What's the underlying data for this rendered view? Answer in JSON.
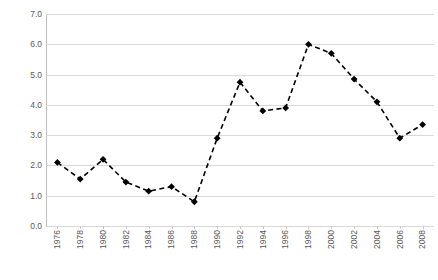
{
  "chart_data": {
    "type": "line",
    "title": "",
    "subtitle": "",
    "xlabel": "",
    "ylabel": "",
    "x": [
      1976,
      1978,
      1980,
      1982,
      1984,
      1986,
      1988,
      1990,
      1992,
      1994,
      1996,
      1998,
      2000,
      2002,
      2004,
      2006,
      2008
    ],
    "categories": [
      "1976",
      "1978",
      "1980",
      "1982",
      "1984",
      "1986",
      "1988",
      "1990",
      "1992",
      "1994",
      "1996",
      "1998",
      "2000",
      "2002",
      "2004",
      "2006",
      "2008"
    ],
    "values": [
      2.1,
      1.55,
      2.2,
      1.45,
      1.15,
      1.3,
      0.8,
      2.9,
      4.75,
      3.8,
      3.9,
      6.0,
      5.7,
      4.85,
      4.1,
      2.9,
      3.35
    ],
    "series": [
      {
        "name": "series-1",
        "values": [
          2.1,
          1.55,
          2.2,
          1.45,
          1.15,
          1.3,
          0.8,
          2.9,
          4.75,
          3.8,
          3.9,
          6.0,
          5.7,
          4.85,
          4.1,
          2.9,
          3.35
        ],
        "line_style": "dashed",
        "line_color": "#000000",
        "marker": "diamond",
        "marker_color": "#000000"
      }
    ],
    "xlim": [
      1975,
      2009
    ],
    "ylim": [
      0.0,
      7.0
    ],
    "ytick_labels": [
      "0.0",
      "1.0",
      "2.0",
      "3.0",
      "4.0",
      "5.0",
      "6.0",
      "7.0"
    ],
    "yticks": [
      0.0,
      1.0,
      2.0,
      3.0,
      4.0,
      5.0,
      6.0,
      7.0
    ],
    "xtick_labels": [
      "1976",
      "1978",
      "1980",
      "1982",
      "1984",
      "1986",
      "1988",
      "1990",
      "1992",
      "1994",
      "1996",
      "1998",
      "2000",
      "2002",
      "2004",
      "2006",
      "2008"
    ],
    "xtick_rotation": 90,
    "grid": true,
    "grid_axis": "y",
    "grid_color": "#d9d9d9",
    "legend": false,
    "legend_position": "none",
    "background_color": "#ffffff",
    "tick_label_color": "#595959"
  }
}
